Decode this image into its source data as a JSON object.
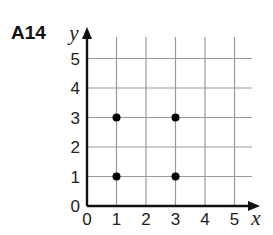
{
  "problem_label": "A14",
  "chart_data": {
    "type": "scatter",
    "title": "",
    "xlabel": "x",
    "ylabel": "y",
    "xlim": [
      0,
      5
    ],
    "ylim": [
      0,
      5
    ],
    "grid": true,
    "x_ticks": [
      "0",
      "1",
      "2",
      "3",
      "4",
      "5"
    ],
    "y_ticks": [
      "0",
      "1",
      "2",
      "3",
      "4",
      "5"
    ],
    "points": [
      {
        "x": 1,
        "y": 1
      },
      {
        "x": 1,
        "y": 3
      },
      {
        "x": 3,
        "y": 1
      },
      {
        "x": 3,
        "y": 3
      }
    ]
  },
  "colors": {
    "axis": "#111111",
    "grid": "#9a9a9a",
    "point": "#000000"
  }
}
